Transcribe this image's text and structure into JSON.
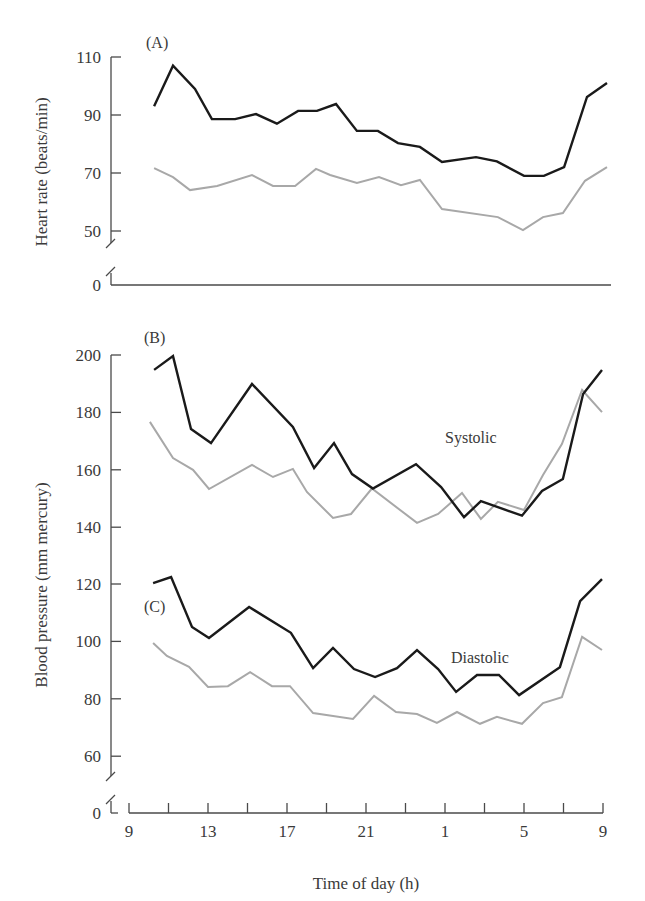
{
  "figure": {
    "panels": [
      {
        "id": "A",
        "label": "(A)",
        "ylabel": "Heart rate (beats/min)",
        "yticks": [
          110,
          90,
          70,
          50
        ],
        "baseline_label": "0",
        "annotation": ""
      },
      {
        "id": "B",
        "label": "(B)",
        "ylabel": "Blood pressure (mm mercury)",
        "yticks": [
          200,
          180,
          160,
          140
        ],
        "baseline_label": "",
        "annotation": "Systolic"
      },
      {
        "id": "C",
        "label": "(C)",
        "ylabel": "",
        "yticks": [
          120,
          100,
          80,
          60
        ],
        "baseline_label": "0",
        "annotation": "Diastolic"
      }
    ],
    "xaxis": {
      "title": "Time of day (h)",
      "tick_labels": [
        "9",
        "13",
        "17",
        "21",
        "1",
        "5",
        "9"
      ]
    },
    "colors": {
      "dark_series": "#1a1a1a",
      "light_series": "#a8a8a8",
      "axis": "#4a4a4a"
    }
  },
  "chart_data": [
    {
      "type": "line",
      "panel": "A",
      "title": "(A)",
      "xlabel": "Time of day (h)",
      "ylabel": "Heart rate (beats/min)",
      "x_unit": "hours after 09:00",
      "xticks": [
        "9",
        "13",
        "17",
        "21",
        "1",
        "5",
        "9"
      ],
      "ylim": [
        0,
        110
      ],
      "yticks": [
        0,
        50,
        70,
        90,
        110
      ],
      "axis_break": true,
      "grid": false,
      "series": [
        {
          "name": "dark line (higher)",
          "color": "#1a1a1a",
          "x": [
            1.27,
            2.23,
            3.34,
            4.2,
            5.37,
            6.43,
            7.49,
            8.56,
            9.52,
            10.48,
            11.54,
            12.6,
            13.62,
            14.73,
            15.85,
            17.57,
            18.63,
            20.0,
            21.01,
            22.03,
            23.19,
            24.2
          ],
          "values": [
            93,
            107,
            99,
            88.6,
            88.6,
            90.3,
            87,
            91.4,
            91.4,
            93.8,
            84.5,
            84.5,
            80.3,
            79,
            73.8,
            75.5,
            74,
            69,
            69,
            72,
            96.2,
            101
          ]
        },
        {
          "name": "light line (lower)",
          "color": "#a8a8a8",
          "x": [
            1.27,
            2.23,
            3.09,
            4.46,
            6.23,
            7.29,
            8.41,
            9.47,
            10.18,
            11.54,
            12.66,
            13.77,
            14.73,
            15.85,
            18.68,
            19.95,
            20.96,
            21.97,
            23.09,
            24.2
          ],
          "values": [
            71.7,
            68.6,
            64.1,
            65.5,
            69.3,
            65.5,
            65.5,
            71.4,
            69.3,
            66.6,
            68.6,
            65.8,
            67.6,
            57.6,
            54.8,
            50.3,
            54.8,
            56.2,
            67.3,
            72
          ]
        }
      ]
    },
    {
      "type": "line",
      "panel": "B",
      "title": "(B)",
      "annotation": "Systolic",
      "xlabel": "Time of day (h)",
      "ylabel": "Blood pressure (mm mercury)",
      "x_unit": "hours after 09:00",
      "ylim": [
        140,
        200
      ],
      "yticks": [
        140,
        160,
        180,
        200
      ],
      "grid": false,
      "series": [
        {
          "name": "dark line",
          "color": "#1a1a1a",
          "x": [
            1.27,
            2.23,
            3.14,
            4.15,
            6.23,
            8.3,
            9.37,
            10.38,
            11.29,
            12.35,
            14.53,
            15.8,
            16.96,
            17.82,
            19.9,
            20.91,
            21.97,
            22.99,
            23.95
          ],
          "values": [
            194.8,
            199.6,
            174.2,
            169.3,
            189.9,
            174.9,
            160.6,
            169.3,
            158.5,
            153.5,
            162,
            154,
            143.5,
            149.1,
            144,
            152.6,
            156.8,
            186.4,
            194.8
          ]
        },
        {
          "name": "light line",
          "color": "#a8a8a8",
          "x": [
            1.06,
            2.23,
            3.24,
            4.05,
            6.23,
            7.29,
            8.3,
            9.01,
            10.33,
            11.24,
            12.3,
            14.58,
            15.65,
            16.86,
            17.82,
            18.68,
            20.0,
            20.96,
            21.92,
            22.94,
            23.95
          ],
          "values": [
            176.7,
            164.1,
            160,
            153.3,
            161.7,
            157.5,
            160.3,
            152.3,
            143.2,
            144.6,
            153.5,
            141.5,
            144.6,
            151.9,
            142.9,
            148.8,
            146,
            158.2,
            169,
            187.8,
            180.1
          ]
        }
      ]
    },
    {
      "type": "line",
      "panel": "C",
      "title": "(C)",
      "annotation": "Diastolic",
      "xlabel": "Time of day (h)",
      "ylabel": "Blood pressure (mm mercury)",
      "x_unit": "hours after 09:00",
      "ylim": [
        0,
        120
      ],
      "yticks": [
        0,
        60,
        80,
        100,
        120
      ],
      "axis_break": true,
      "grid": false,
      "series": [
        {
          "name": "dark line",
          "color": "#1a1a1a",
          "x": [
            1.22,
            2.13,
            3.19,
            4.05,
            6.08,
            8.2,
            9.32,
            10.33,
            11.39,
            12.46,
            13.57,
            14.58,
            15.65,
            16.56,
            17.62,
            18.73,
            19.75,
            21.82,
            22.84,
            23.95
          ],
          "values": [
            120.3,
            122.4,
            105,
            101.2,
            112,
            103,
            90.7,
            97.7,
            90.4,
            87.6,
            90.7,
            97,
            90.4,
            82.4,
            88.3,
            88.3,
            81.3,
            91,
            114,
            121.7
          ]
        },
        {
          "name": "light line",
          "color": "#a8a8a8",
          "x": [
            1.22,
            1.92,
            3.04,
            4.0,
            5.01,
            6.13,
            7.24,
            8.15,
            9.32,
            11.34,
            12.41,
            13.52,
            14.58,
            15.59,
            16.61,
            17.77,
            18.63,
            19.9,
            20.96,
            21.92,
            22.94,
            23.95
          ],
          "values": [
            99.4,
            94.9,
            91.1,
            84.1,
            84.4,
            89.3,
            84.4,
            84.4,
            75,
            73,
            81,
            75.4,
            74.7,
            71.6,
            75.4,
            71.3,
            73.7,
            71.3,
            78.5,
            80.6,
            101.6,
            97
          ]
        }
      ]
    }
  ]
}
